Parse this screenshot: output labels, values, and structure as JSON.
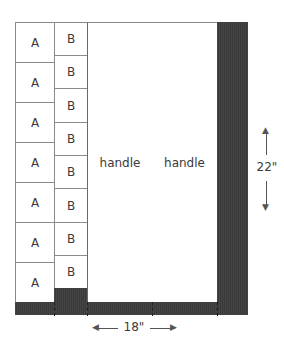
{
  "diagram": {
    "type": "bag-layout",
    "column_a": {
      "label": "A",
      "cells": [
        "A",
        "A",
        "A",
        "A",
        "A",
        "A",
        "A"
      ]
    },
    "column_b": {
      "label": "B",
      "cells": [
        "B",
        "B",
        "B",
        "B",
        "B",
        "B",
        "B",
        "B"
      ]
    },
    "handles": [
      {
        "label": "handle"
      },
      {
        "label": "handle"
      }
    ],
    "dimensions": {
      "width": "18\"",
      "height": "22\""
    },
    "colors": {
      "outline": "#8a8a8a",
      "dark_fabric": "#3f3f3f",
      "background": "#ffffff",
      "text": "#3a3a3a"
    }
  }
}
